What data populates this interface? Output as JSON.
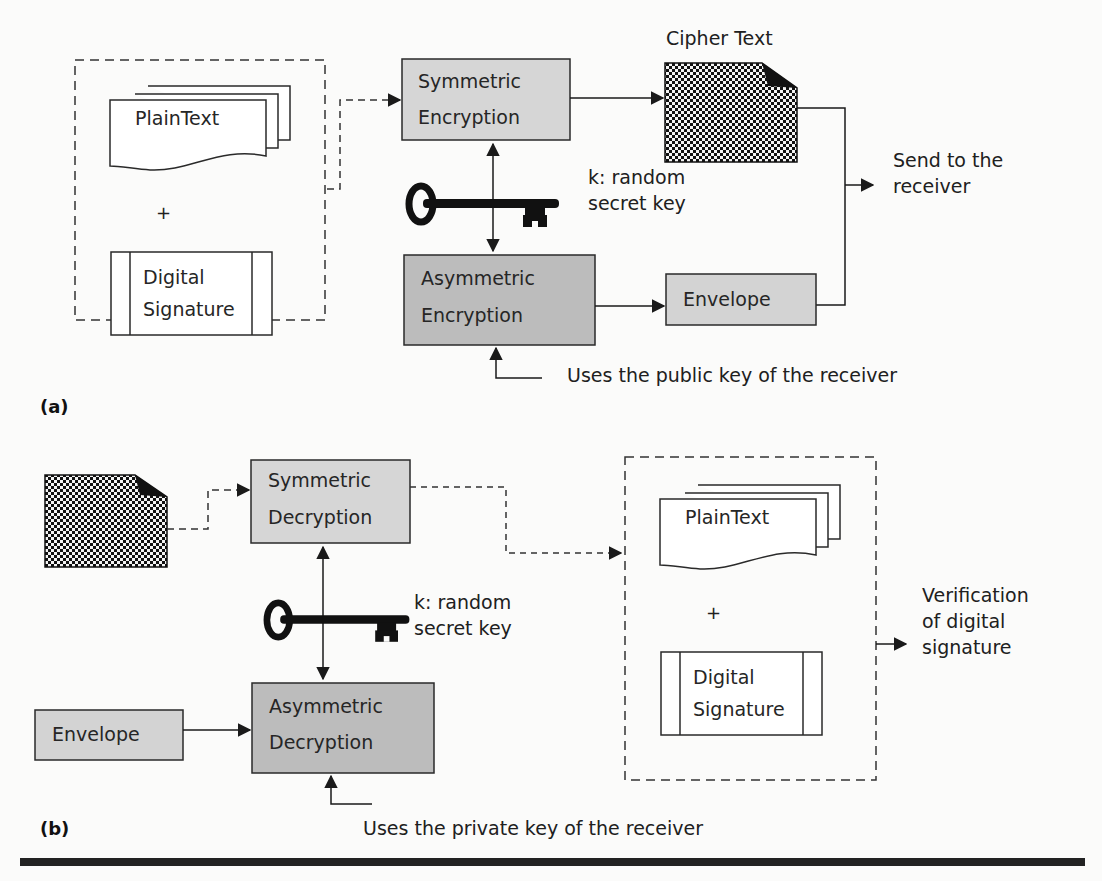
{
  "colors": {
    "background": "#fbfbfa",
    "symmetric_box_fill": "#d6d6d6",
    "asymmetric_box_fill": "#bcbcbc",
    "envelope_fill": "#d3d3d3",
    "stroke": "#2a2a2a",
    "rule": "#222222"
  },
  "panel_a": {
    "label": "(a)",
    "sender_group": {
      "plaintext": "PlainText",
      "plus": "+",
      "signature_line1": "Digital",
      "signature_line2": "Signature"
    },
    "symmetric": {
      "line1": "Symmetric",
      "line2": "Encryption"
    },
    "asymmetric": {
      "line1": "Asymmetric",
      "line2": "Encryption"
    },
    "key_label_line1": "k: random",
    "key_label_line2": "secret key",
    "cipher_label": "Cipher Text",
    "envelope": "Envelope",
    "send_line1": "Send to the",
    "send_line2": "receiver",
    "public_key_note": "Uses the public key of the receiver"
  },
  "panel_b": {
    "label": "(b)",
    "symmetric": {
      "line1": "Symmetric",
      "line2": "Decryption"
    },
    "asymmetric": {
      "line1": "Asymmetric",
      "line2": "Decryption"
    },
    "key_label_line1": "k: random",
    "key_label_line2": "secret key",
    "envelope": "Envelope",
    "receiver_group": {
      "plaintext": "PlainText",
      "plus": "+",
      "signature_line1": "Digital",
      "signature_line2": "Signature"
    },
    "verify_line1": "Verification",
    "verify_line2": "of digital",
    "verify_line3": "signature",
    "private_key_note": "Uses the private key of the receiver"
  }
}
